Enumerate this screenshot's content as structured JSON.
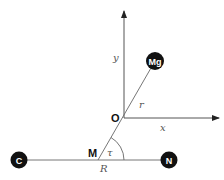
{
  "diagram": {
    "type": "coordinate-system-molecular",
    "colors": {
      "line": "#555555",
      "atom_fill": "#111111",
      "atom_text": "#ffffff",
      "background": "#ffffff"
    },
    "axes": {
      "x_label": "x",
      "y_label": "y",
      "origin_label": "O"
    },
    "atoms": [
      {
        "id": "mg",
        "label": "Mg"
      },
      {
        "id": "c",
        "label": "C"
      },
      {
        "id": "n",
        "label": "N"
      }
    ],
    "points": {
      "midpoint_label": "M"
    },
    "quantities": {
      "distance_r": "r",
      "distance_R": "R",
      "angle": "τ"
    }
  }
}
